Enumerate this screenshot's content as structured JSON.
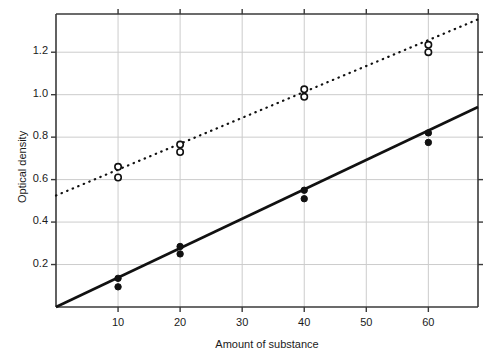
{
  "chart_data": {
    "type": "scatter",
    "title": "",
    "xlabel": "Amount of substance",
    "ylabel": "Optical density",
    "xlim": [
      0,
      68
    ],
    "ylim": [
      0,
      1.38
    ],
    "xticks": [
      10,
      20,
      30,
      40,
      50,
      60
    ],
    "xtick_labels": [
      "10",
      "20",
      "30",
      "40",
      "50",
      "60"
    ],
    "yticks": [
      0.2,
      0.4,
      0.6,
      0.8,
      1.0,
      1.2
    ],
    "ytick_labels": [
      "0.2",
      "0.4",
      "0.6",
      "0.8",
      "1.0",
      "1.2"
    ],
    "grid": true,
    "grid_color": "#cccccc",
    "legend": "none",
    "series": [
      {
        "name": "open-circles",
        "marker": "open-circle",
        "line_style": "dotted",
        "color": "#111111",
        "points": [
          {
            "x": 10,
            "y": 0.66
          },
          {
            "x": 10,
            "y": 0.61
          },
          {
            "x": 20,
            "y": 0.765
          },
          {
            "x": 20,
            "y": 0.73
          },
          {
            "x": 40,
            "y": 1.025
          },
          {
            "x": 40,
            "y": 0.99
          },
          {
            "x": 60,
            "y": 1.235
          },
          {
            "x": 60,
            "y": 1.2
          }
        ],
        "fit_line": {
          "intercept": 0.525,
          "slope": 0.0122
        }
      },
      {
        "name": "filled-circles",
        "marker": "filled-circle",
        "line_style": "solid",
        "color": "#111111",
        "points": [
          {
            "x": 10,
            "y": 0.135
          },
          {
            "x": 10,
            "y": 0.095
          },
          {
            "x": 20,
            "y": 0.285
          },
          {
            "x": 20,
            "y": 0.25
          },
          {
            "x": 40,
            "y": 0.55
          },
          {
            "x": 40,
            "y": 0.51
          },
          {
            "x": 60,
            "y": 0.82
          },
          {
            "x": 60,
            "y": 0.775
          }
        ],
        "fit_line": {
          "intercept": 0.0,
          "slope": 0.01385
        }
      }
    ]
  }
}
